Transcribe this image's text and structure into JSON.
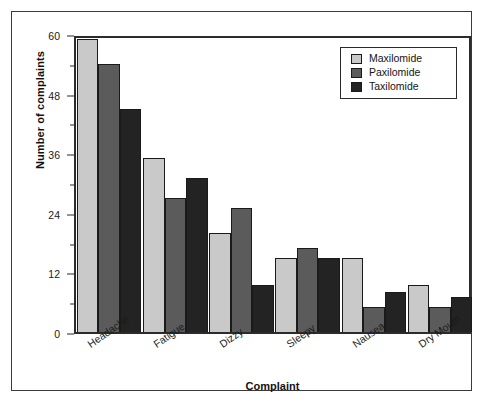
{
  "chart_data": {
    "type": "bar",
    "title": "",
    "xlabel": "Complaint",
    "ylabel": "Number of complaints",
    "categories": [
      "Headache",
      "Fatigue",
      "Dizzy",
      "Sleepy",
      "Nausea",
      "Dry Mouth"
    ],
    "series": [
      {
        "name": "Maxilomide",
        "color": "#c9c9c9",
        "values": [
          59,
          35,
          20,
          15,
          15,
          9.5
        ]
      },
      {
        "name": "Paxilomide",
        "color": "#5b5b5b",
        "values": [
          54,
          27,
          25,
          17,
          5,
          5
        ]
      },
      {
        "name": "Taxilomide",
        "color": "#232323",
        "values": [
          45,
          31,
          9.5,
          15,
          8,
          7
        ]
      }
    ],
    "ylim": [
      0,
      60
    ],
    "yticks": [
      0,
      12,
      24,
      36,
      48,
      60
    ],
    "ytick_labels": [
      "0",
      "12",
      "24",
      "36",
      "48",
      "60"
    ],
    "yminor_ticks": [
      6,
      18,
      30,
      42,
      54
    ],
    "grid": false,
    "legend_position": "top-right"
  },
  "axes": {
    "y_title": "Number of complaints",
    "x_title": "Complaint"
  },
  "legend": {
    "entries": [
      {
        "label": "Maxilomide"
      },
      {
        "label": "Paxilomide"
      },
      {
        "label": "Taxilomide"
      }
    ]
  }
}
